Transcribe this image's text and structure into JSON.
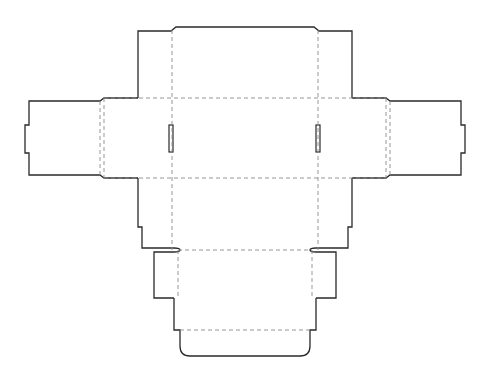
{
  "diagram": {
    "type": "box-dieline",
    "description": "Flat unfolded packaging box template with cut lines and dashed fold lines",
    "colors": {
      "cut_line": "#2a2a2a",
      "fold_line": "#8a8a8a",
      "background": "#ffffff"
    },
    "legend": {
      "cut_line": "solid",
      "fold_line": "dashed"
    },
    "panels": [
      {
        "name": "top-dust-flap-assembly"
      },
      {
        "name": "left-outer-flap"
      },
      {
        "name": "left-side-panel"
      },
      {
        "name": "center-front-panel"
      },
      {
        "name": "right-side-panel"
      },
      {
        "name": "right-outer-flap"
      },
      {
        "name": "lower-panel"
      },
      {
        "name": "left-tuck-tab"
      },
      {
        "name": "right-tuck-tab"
      },
      {
        "name": "bottom-panel"
      },
      {
        "name": "bottom-tuck-flap"
      }
    ],
    "slots": [
      {
        "name": "left-lock-slot"
      },
      {
        "name": "right-lock-slot"
      }
    ]
  }
}
